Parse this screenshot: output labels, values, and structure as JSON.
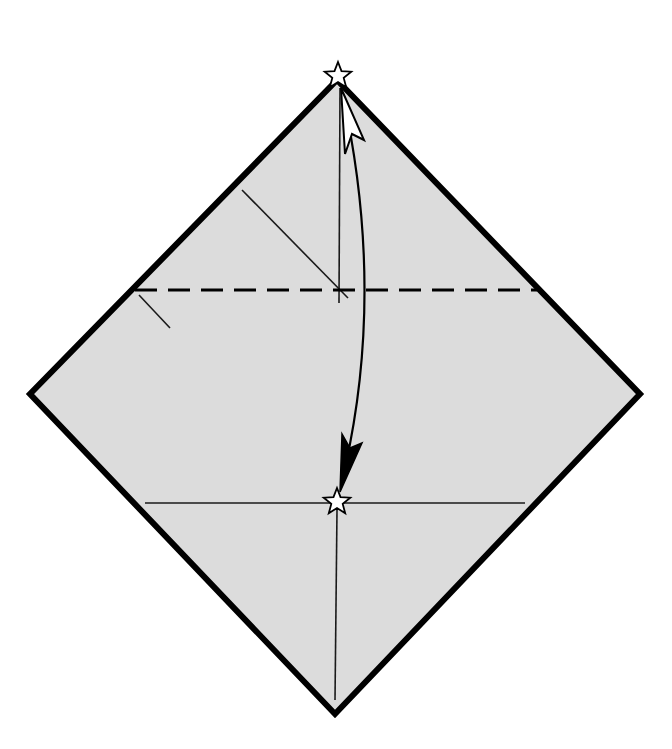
{
  "diagram": {
    "type": "origami-fold-step",
    "colors": {
      "paper_fill": "#dcdcdc",
      "outline": "#000000",
      "background": "#ffffff",
      "star_fill": "#ffffff"
    },
    "paper": {
      "shape": "square-rotated-diamond",
      "vertices": {
        "top": [
          337,
          80
        ],
        "right": [
          640,
          394
        ],
        "bottom": [
          335,
          714
        ],
        "left": [
          30,
          394
        ]
      }
    },
    "valley_fold_line": {
      "x1": 135,
      "y1": 290,
      "x2": 537,
      "y2": 290,
      "style": "dashed"
    },
    "creases": [
      {
        "name": "vertical-upper",
        "x1": 340,
        "y1": 88,
        "x2": 339,
        "y2": 303
      },
      {
        "name": "vertical-lower",
        "x1": 337,
        "y1": 510,
        "x2": 335,
        "y2": 700
      },
      {
        "name": "horizontal-lower",
        "x1": 145,
        "y1": 503,
        "x2": 525,
        "y2": 503
      },
      {
        "name": "diagonal-upper",
        "x1": 242,
        "y1": 190,
        "x2": 348,
        "y2": 298
      },
      {
        "name": "diagonal-short",
        "x1": 139,
        "y1": 295,
        "x2": 170,
        "y2": 328
      }
    ],
    "reference_marks": [
      {
        "name": "star-top",
        "cx": 338,
        "cy": 76,
        "symbol": "star"
      },
      {
        "name": "star-target",
        "cx": 337,
        "cy": 502,
        "symbol": "star"
      }
    ],
    "arrow": {
      "meaning": "valley-fold top corner down to star",
      "path_start": [
        345,
        100
      ],
      "path_end": [
        342,
        490
      ],
      "start_head": "hollow",
      "end_head": "filled"
    }
  }
}
